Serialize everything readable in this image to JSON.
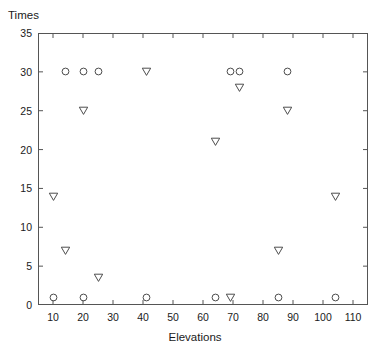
{
  "chart_data": {
    "type": "scatter",
    "title": "",
    "xlabel": "Elevations",
    "ylabel": "Times",
    "xlim": [
      5,
      115
    ],
    "ylim": [
      0,
      35
    ],
    "xticks": [
      10,
      20,
      30,
      40,
      50,
      60,
      70,
      80,
      90,
      100,
      110
    ],
    "yticks": [
      0,
      5,
      10,
      15,
      20,
      25,
      30,
      35
    ],
    "grid": false,
    "legend": false,
    "legend_position": "none",
    "series": [
      {
        "name": "circle-series",
        "marker": "circle",
        "color": "#4d4d4d",
        "points": [
          {
            "x": 10,
            "y": 1
          },
          {
            "x": 14,
            "y": 30
          },
          {
            "x": 20,
            "y": 1
          },
          {
            "x": 20,
            "y": 30
          },
          {
            "x": 25,
            "y": 30
          },
          {
            "x": 41,
            "y": 1
          },
          {
            "x": 64,
            "y": 1
          },
          {
            "x": 69,
            "y": 30
          },
          {
            "x": 72,
            "y": 30
          },
          {
            "x": 85,
            "y": 1
          },
          {
            "x": 88,
            "y": 30
          },
          {
            "x": 104,
            "y": 1
          }
        ]
      },
      {
        "name": "triangle-series",
        "marker": "triangle-down",
        "color": "#4d4d4d",
        "points": [
          {
            "x": 10,
            "y": 14
          },
          {
            "x": 14,
            "y": 7
          },
          {
            "x": 20,
            "y": 25
          },
          {
            "x": 25,
            "y": 3.5
          },
          {
            "x": 41,
            "y": 30
          },
          {
            "x": 64,
            "y": 21
          },
          {
            "x": 69,
            "y": 1
          },
          {
            "x": 72,
            "y": 28
          },
          {
            "x": 85,
            "y": 7
          },
          {
            "x": 88,
            "y": 25
          },
          {
            "x": 104,
            "y": 14
          }
        ]
      }
    ]
  },
  "axes": {
    "y_title": "Times",
    "x_title": "Elevations",
    "y_tick_labels": [
      "0",
      "5",
      "10",
      "15",
      "20",
      "25",
      "30",
      "35"
    ],
    "x_tick_labels": [
      "10",
      "20",
      "30",
      "40",
      "50",
      "60",
      "70",
      "80",
      "90",
      "100",
      "110"
    ]
  },
  "style": {
    "axis_color": "#555555",
    "marker_color": "#4d4d4d",
    "background": "#ffffff"
  }
}
